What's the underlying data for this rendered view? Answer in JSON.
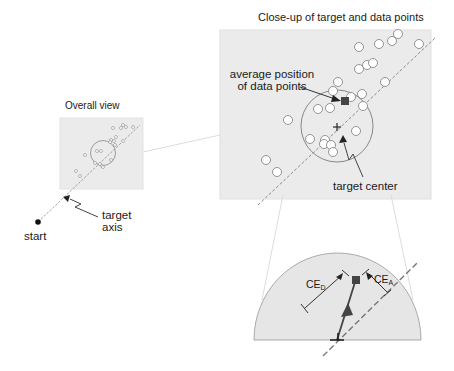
{
  "titles": {
    "closeup": "Close-up of target and data points",
    "overall": "Overall view"
  },
  "labels": {
    "average_line1": "average position",
    "average_line2": "of data points",
    "target_center": "target center",
    "target_axis_line1": "target",
    "target_axis_line2": "axis",
    "start": "start",
    "ce_d_main": "CE",
    "ce_d_sub": "D",
    "ce_a_main": "CE",
    "ce_a_sub": "A"
  },
  "colors": {
    "panel_fill": "#ebebeb",
    "panel_stroke": "#d8d8d8",
    "stroke": "#555555",
    "marker": "#444444",
    "dashed_axis": "#888888",
    "connector": "#dddddd"
  },
  "closeup_points": [
    [
      359,
      69
    ],
    [
      379,
      64
    ],
    [
      393,
      61
    ],
    [
      389,
      71
    ],
    [
      420,
      66
    ],
    [
      338,
      82
    ],
    [
      367,
      82
    ],
    [
      376,
      85
    ],
    [
      342,
      101
    ],
    [
      362,
      96
    ],
    [
      374,
      96
    ],
    [
      363,
      110
    ],
    [
      318,
      109
    ],
    [
      330,
      108
    ],
    [
      288,
      120
    ],
    [
      363,
      135
    ],
    [
      310,
      139
    ],
    [
      325,
      143
    ],
    [
      323,
      148
    ],
    [
      331,
      145
    ],
    [
      333,
      151
    ],
    [
      266,
      160
    ],
    [
      276,
      173
    ]
  ]
}
